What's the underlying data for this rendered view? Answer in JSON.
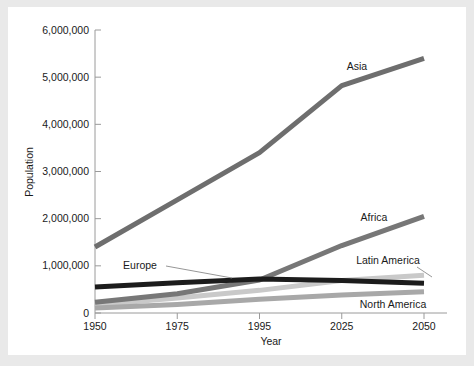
{
  "chart_data": {
    "type": "line",
    "title": "",
    "xlabel": "Year",
    "ylabel": "Population",
    "categories": [
      "1950",
      "1975",
      "1995",
      "2025",
      "2050"
    ],
    "ylim": [
      0,
      6000000
    ],
    "yticks": [
      0,
      1000000,
      2000000,
      3000000,
      4000000,
      5000000,
      6000000
    ],
    "ytick_labels": [
      "0",
      "1,000,000",
      "2,000,000",
      "3,000,000",
      "4,000,000",
      "5,000,000",
      "6,000,000"
    ],
    "grid": false,
    "legend": "inline-labels",
    "series": [
      {
        "name": "Asia",
        "color": "#6e6e6e",
        "values": [
          1400000,
          2400000,
          3400000,
          4820000,
          5400000
        ]
      },
      {
        "name": "Africa",
        "color": "#777777",
        "values": [
          230000,
          410000,
          700000,
          1430000,
          2050000
        ]
      },
      {
        "name": "Europe",
        "color": "#1c1c1c",
        "values": [
          550000,
          640000,
          720000,
          690000,
          630000
        ]
      },
      {
        "name": "Latin America",
        "color": "#c9c9c9",
        "values": [
          170000,
          320000,
          480000,
          690000,
          800000
        ]
      },
      {
        "name": "North America",
        "color": "#a8a8a8",
        "values": [
          105000,
          180000,
          290000,
          380000,
          450000
        ]
      }
    ],
    "annotations": [
      {
        "name": "Asia",
        "leader": false
      },
      {
        "name": "Africa",
        "leader": false
      },
      {
        "name": "Europe",
        "leader": true
      },
      {
        "name": "Latin America",
        "leader": true
      },
      {
        "name": "North America",
        "leader": false
      }
    ]
  },
  "axes": {
    "x_axis_label": "Year",
    "y_axis_label": "Population"
  },
  "colors": {
    "background": "#e9e9e9",
    "card": "#ffffff",
    "axis": "#9a9a9a",
    "text": "#1a1a1a"
  }
}
